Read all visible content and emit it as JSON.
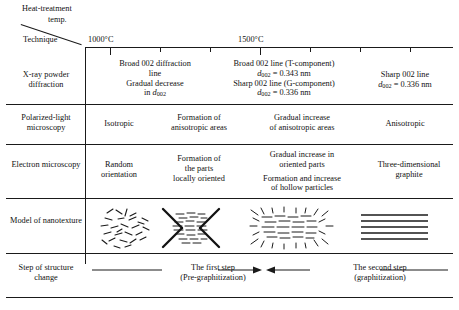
{
  "figure": {
    "header": {
      "column_axis_title": "Heat-treatment temp.",
      "row_axis_title": "Technique",
      "axis_ticks": [
        "1000°C",
        "1500°C"
      ]
    },
    "rows": [
      {
        "label": "X-ray powder diffraction",
        "cells": [
          {
            "lines": []
          },
          {
            "lines": [
              "Broad 002 diffraction",
              "line",
              "Gradual decrease",
              "in d002"
            ]
          },
          {
            "lines": [
              "Broad 002 line (T-component)",
              "d002 = 0.343 nm",
              "Sharp 002 line (G-component)",
              "d002 = 0.336 nm"
            ]
          },
          {
            "lines": [
              "Sharp 002 line",
              "d002 = 0.336 nm"
            ]
          }
        ]
      },
      {
        "label": "Polarized-light microscopy",
        "cells": [
          {
            "lines": [
              "Isotropic"
            ]
          },
          {
            "lines": [
              "Formation of",
              "anisotropic areas"
            ]
          },
          {
            "lines": [
              "Gradual increase",
              "of anisotropic areas"
            ]
          },
          {
            "lines": [
              "Anisotropic"
            ]
          }
        ]
      },
      {
        "label": "Electron microscopy",
        "cells": [
          {
            "lines": [
              "Random",
              "orientation"
            ]
          },
          {
            "lines": [
              "Formation of",
              "the parts",
              "locally oriented"
            ]
          },
          {
            "lines": [
              "Gradual increase in",
              "oriented parts",
              "",
              "Formation and increase",
              "of hollow particles"
            ]
          },
          {
            "lines": [
              "Three-dimensional",
              "graphite"
            ]
          }
        ]
      },
      {
        "label": "Model of nanotexture",
        "cells": [
          {
            "model": "random-fragments"
          },
          {
            "model": "bowtie-oriented"
          },
          {
            "model": "hollow-particles"
          },
          {
            "model": "parallel-layers"
          }
        ]
      },
      {
        "label": "Step of structure change",
        "steps": [
          {
            "title": "The first step",
            "subtitle": "(Pre-graphitization)"
          },
          {
            "title": "The second step",
            "subtitle": "(graphitization)"
          }
        ]
      }
    ]
  }
}
